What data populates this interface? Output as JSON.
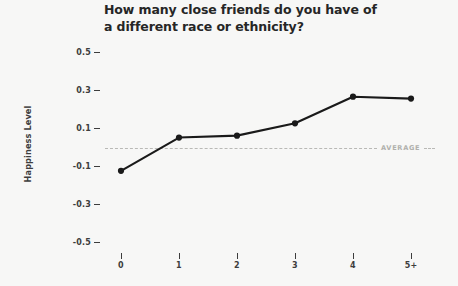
{
  "chart_data": {
    "type": "line",
    "title": "How many close friends do you have of\na different race or ethnicity?",
    "xlabel": "",
    "ylabel": "Happiness Level",
    "categories": [
      "0",
      "1",
      "2",
      "3",
      "4",
      "5+"
    ],
    "values": [
      -0.12,
      0.055,
      0.065,
      0.13,
      0.27,
      0.26
    ],
    "series": [
      {
        "name": "Happiness Level",
        "values": [
          -0.12,
          0.055,
          0.065,
          0.13,
          0.27,
          0.26
        ]
      }
    ],
    "ylim": [
      -0.6,
      0.6
    ],
    "yticks": [
      0.5,
      0.3,
      0.1,
      -0.1,
      -0.3,
      -0.5
    ],
    "ytick_labels": [
      "0.5",
      "0.3",
      "0.1",
      "-0.1",
      "-0.3",
      "-0.5"
    ],
    "xtick_labels": [
      "0",
      "1",
      "2",
      "3",
      "4",
      "5+"
    ],
    "grid": false,
    "legend": false,
    "annotations": [
      {
        "name": "average-reference-line",
        "label": "AVERAGE",
        "value": 0,
        "style": "dashed"
      }
    ],
    "colors": {
      "background": "#f7f7f6",
      "line": "#1a1a1a",
      "marker": "#1a1a1a",
      "text": "#3d3d3d",
      "title": "#262626",
      "average": "#b9b9b6",
      "average_label": "#b0b0ac"
    }
  }
}
